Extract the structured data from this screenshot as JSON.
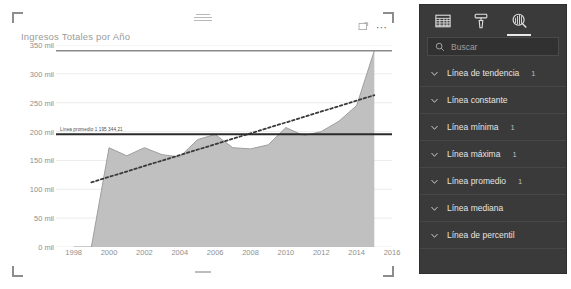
{
  "visual": {
    "title": "Ingresos Totales por Año",
    "focus_icon": "focus-mode-icon",
    "more_icon": "more-options-icon",
    "top_grip_icon": "drag-handle-icon",
    "bottom_grip_icon": "drag-handle-icon"
  },
  "chart_data": {
    "type": "area",
    "title": "Ingresos Totales por Año",
    "xlabel": "",
    "ylabel": "",
    "grid": true,
    "legend": "none",
    "xlim": [
      1997,
      2016
    ],
    "ylim": [
      0,
      350000
    ],
    "ytick_labels": [
      "0 mil",
      "50 mil",
      "100 mil",
      "150 mil",
      "200 mil",
      "250 mil",
      "300 mil",
      "350 mil"
    ],
    "ytick_values": [
      0,
      50000,
      100000,
      150000,
      200000,
      250000,
      300000,
      350000
    ],
    "xtick_labels": [
      "1998",
      "2000",
      "2002",
      "2004",
      "2006",
      "2008",
      "2010",
      "2012",
      "2014",
      "2016"
    ],
    "xtick_values": [
      1998,
      2000,
      2002,
      2004,
      2006,
      2008,
      2010,
      2012,
      2014,
      2016
    ],
    "x": [
      1998,
      1999,
      2000,
      2001,
      2002,
      2003,
      2004,
      2005,
      2006,
      2007,
      2008,
      2009,
      2010,
      2011,
      2012,
      2013,
      2014,
      2015
    ],
    "values": [
      0,
      0,
      172000,
      158000,
      172000,
      160000,
      156000,
      186000,
      195000,
      172000,
      170000,
      177000,
      207000,
      193000,
      200000,
      218000,
      245000,
      340000
    ],
    "series": [
      {
        "name": "Ingresos Totales",
        "type": "area",
        "color": "#bdbdbd",
        "values": [
          0,
          0,
          172000,
          158000,
          172000,
          160000,
          156000,
          186000,
          195000,
          172000,
          170000,
          177000,
          207000,
          193000,
          200000,
          218000,
          245000,
          340000
        ]
      },
      {
        "name": "Línea de tendencia",
        "type": "line",
        "style": "dotted",
        "color": "#3a3a3a",
        "x": [
          1999,
          2015
        ],
        "values": [
          112000,
          263000
        ]
      },
      {
        "name": "Línea promedio",
        "type": "constant-line",
        "color": "#2b2b2b",
        "value": 195344.21,
        "label": "Línea promedio 1 195 344,21"
      },
      {
        "name": "Línea máxima",
        "type": "constant-line",
        "color": "#8a8a8a",
        "value": 340000,
        "label": ""
      }
    ]
  },
  "pane": {
    "tabs": [
      {
        "name": "fields-tab",
        "icon": "fields-table-icon",
        "active": false
      },
      {
        "name": "format-tab",
        "icon": "paint-roller-icon",
        "active": false
      },
      {
        "name": "analytics-tab",
        "icon": "analytics-magnifier-icon",
        "active": true
      }
    ],
    "search": {
      "placeholder": "Buscar",
      "value": "",
      "icon": "search-icon"
    },
    "cards": [
      {
        "label": "Línea de tendencia",
        "count": "1",
        "chevron": "chevron-down-icon"
      },
      {
        "label": "Línea constante",
        "count": "",
        "chevron": "chevron-down-icon"
      },
      {
        "label": "Línea mínima",
        "count": "1",
        "chevron": "chevron-down-icon"
      },
      {
        "label": "Línea máxima",
        "count": "1",
        "chevron": "chevron-down-icon"
      },
      {
        "label": "Línea promedio",
        "count": "1",
        "chevron": "chevron-down-icon"
      },
      {
        "label": "Línea mediana",
        "count": "",
        "chevron": "chevron-down-icon"
      },
      {
        "label": "Línea de percentil",
        "count": "",
        "chevron": "chevron-down-icon"
      }
    ]
  },
  "colors": {
    "pane_bg": "#3a3a3a",
    "area_fill": "#bdbdbd",
    "canvas_bg": "#ffffff",
    "axis_text": "#8f8f8f"
  }
}
